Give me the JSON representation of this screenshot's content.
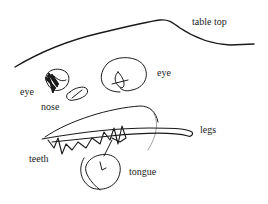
{
  "drawing": {
    "ink_color": "#1a1a1a",
    "labels": {
      "table_top": "table top",
      "eye_left": "eye",
      "eye_right": "eye",
      "nose": "nose",
      "legs": "legs",
      "teeth": "teeth",
      "tongue": "tongue"
    }
  }
}
